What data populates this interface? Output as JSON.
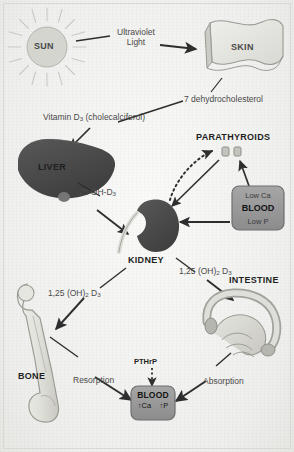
{
  "diagram": {
    "type": "flow-diagram"
  },
  "nodes": {
    "sun": {
      "label": "SUN",
      "icon": "sun-icon"
    },
    "skin": {
      "label": "SKIN",
      "icon": "skin-sheet-icon"
    },
    "liver": {
      "label": "LIVER",
      "icon": "liver-icon"
    },
    "kidney": {
      "label": "KIDNEY",
      "icon": "kidney-icon"
    },
    "parathyroids": {
      "label": "PARATHYROIDS",
      "icon": "parathyroid-glands-icon"
    },
    "intestine": {
      "label": "INTESTINE",
      "icon": "intestine-icon"
    },
    "bone": {
      "label": "BONE",
      "icon": "femur-bone-icon"
    },
    "low_blood_box": {
      "line1": "Low Ca",
      "line2": "BLOOD",
      "line3": "Low P"
    },
    "blood_box": {
      "title": "BLOOD",
      "ca_arrow": "↑",
      "ca_label": "Ca",
      "p_arrow": "↑",
      "p_label": "P"
    }
  },
  "edge_labels": {
    "ultraviolet": {
      "line1": "Ultraviolet",
      "line2": "Light"
    },
    "dehydrocholesterol": "7 dehydrocholesterol",
    "vitamin_d3": "Vitamin D3 (cholecalciferol)",
    "vitamin_d3_parts": {
      "pre": "Vitamin D",
      "sub": "3",
      "post": " (cholecalciferol)"
    },
    "oh_d3": {
      "pre": "25 OH-D",
      "sub": "3"
    },
    "calcitriol_bone": {
      "pre": "1,25 (OH)",
      "sub1": "2",
      "mid": " D",
      "sub2": "3"
    },
    "calcitriol_intestine": {
      "pre": "1,25 (OH)",
      "sub1": "2",
      "mid": " D",
      "sub2": "3"
    },
    "resorption": "Resorption",
    "absorption": "Absorption",
    "pthrp": "PTHrP"
  },
  "colors": {
    "background": "#f2f2f0",
    "organ_dark": "#4a4a4a",
    "organ_mid": "#8f8f8f",
    "organ_light": "#d6d6d2",
    "box_fill": "#9a9a9a",
    "text": "#4a4a4a",
    "arrow": "#2e2e2e"
  }
}
